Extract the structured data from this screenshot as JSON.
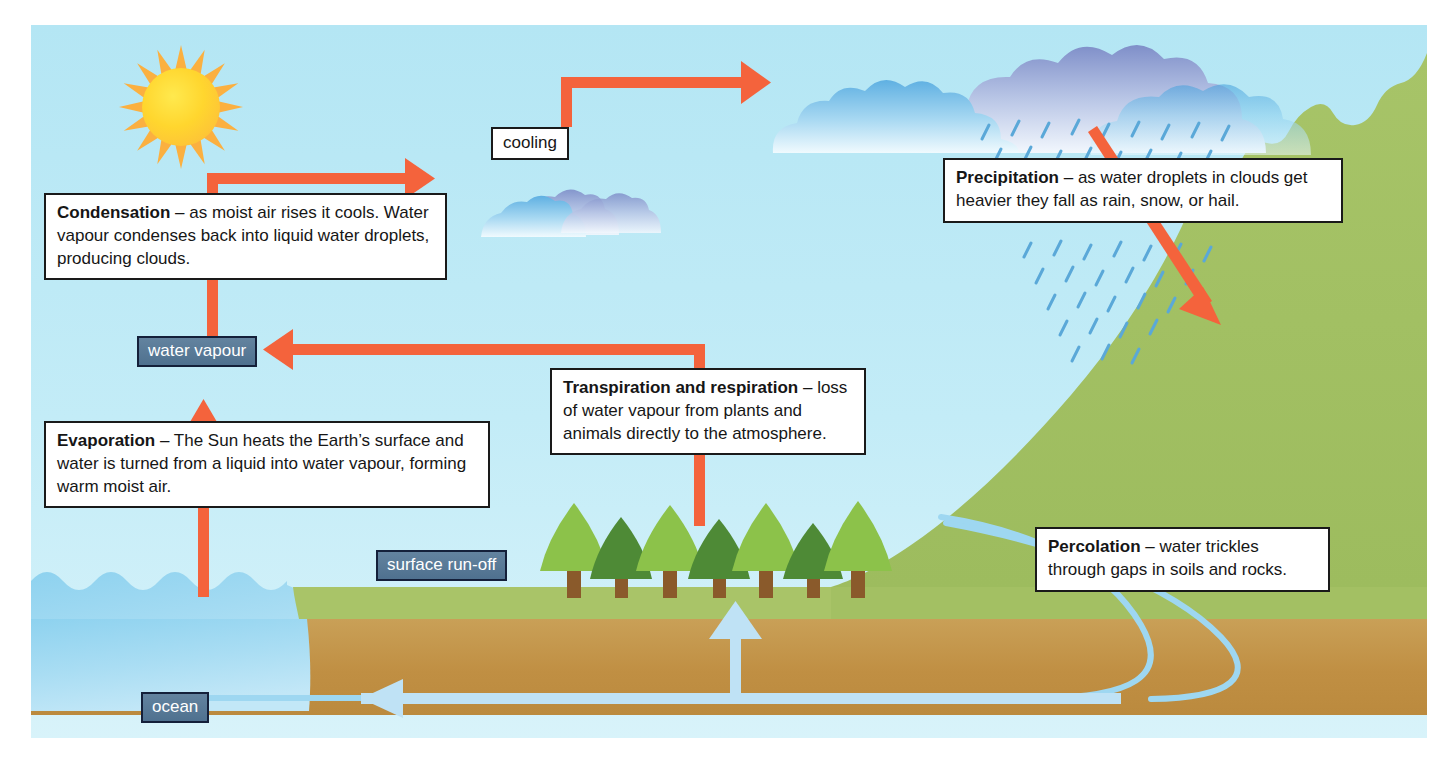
{
  "diagram": {
    "type": "water-cycle-diagram",
    "palette": {
      "sky": "#b8e8f5",
      "arrow_orange": "#f4633c",
      "water_blue": "#9fd7f0",
      "grass_green": "#a9c46a",
      "hill_green": "#a3c063",
      "soil_brown": "#c0903f",
      "tag_blue": "#587a98",
      "cloud_blue": "#4fa8de",
      "tree_light": "#8cc24a",
      "tree_dark": "#4e8a36",
      "trunk_brown": "#8a5a2b",
      "sun_yellow": "#ffd62e"
    }
  },
  "labels": {
    "cooling": "cooling",
    "water_vapour": "water vapour",
    "surface_runoff": "surface run-off",
    "ocean": "ocean"
  },
  "callouts": {
    "condensation": {
      "term": "Condensation",
      "dash": " – ",
      "text": "as moist air rises it cools. Water vapour condenses back into liquid water droplets, producing clouds."
    },
    "evaporation": {
      "term": "Evaporation",
      "dash": " – ",
      "text": "The Sun heats the Earth’s surface and water is turned from a liquid into water vapour, forming warm moist air."
    },
    "transpiration": {
      "term": "Transpiration and respiration",
      "dash": " – ",
      "text": "loss of water vapour from plants and animals directly to the atmosphere."
    },
    "precipitation": {
      "term": "Precipitation",
      "dash": " – ",
      "text": "as water droplets in clouds get heavier they fall as rain, snow, or hail."
    },
    "percolation": {
      "term": "Percolation",
      "dash": " – ",
      "text": "water trickles through gaps in soils and rocks."
    }
  },
  "scene": {
    "sun": "sun-icon",
    "small_cloud": "small-cloud",
    "big_clouds": "cloud-bank",
    "rain": "rain-droplets",
    "trees_count": 7,
    "hill": "green-hill",
    "ocean_body": "ocean-water",
    "soil_body": "soil-layer"
  },
  "arrows": {
    "evaporation_up": "orange-arrow-up",
    "condensation_up_right": "orange-elbow-arrow-right",
    "cooling_to_cloud": "orange-elbow-arrow-right",
    "transpiration_to_vapour": "orange-elbow-arrow-left",
    "precipitation_down": "orange-arrow-down-right",
    "runoff_up": "blue-arrow-up",
    "groundwater_left": "blue-arrow-left",
    "percolation_curves": "blue-curve"
  }
}
